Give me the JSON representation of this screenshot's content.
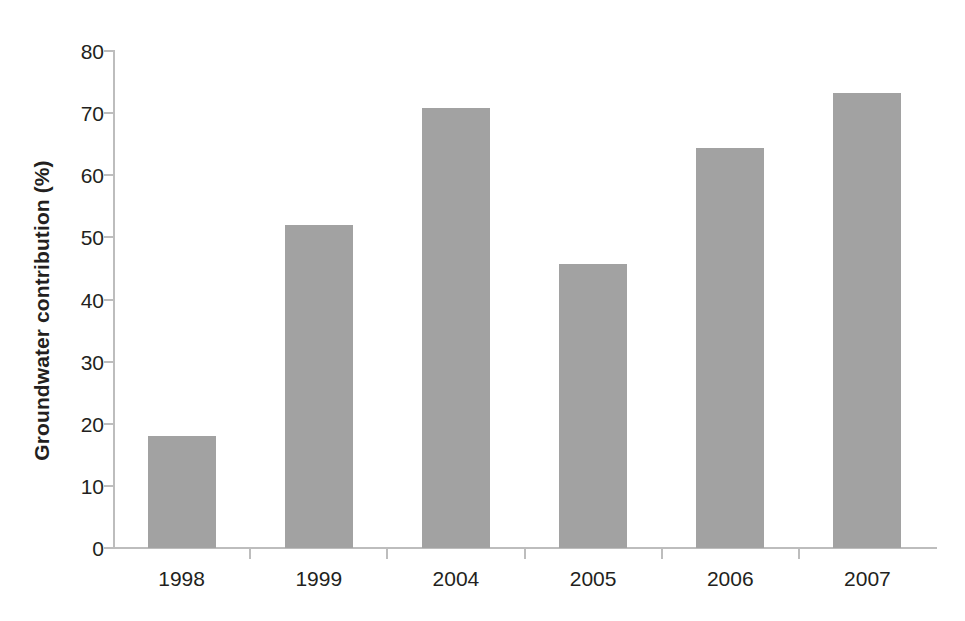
{
  "chart_data": {
    "type": "bar",
    "title": "",
    "xlabel": "",
    "ylabel": "Groundwater contribution (%)",
    "categories": [
      "1998",
      "1999",
      "2004",
      "2005",
      "2006",
      "2007"
    ],
    "values": [
      18.0,
      52.0,
      70.8,
      45.7,
      64.4,
      73.3
    ],
    "series": [
      {
        "name": "Groundwater contribution",
        "values": [
          18.0,
          52.0,
          70.8,
          45.7,
          64.4,
          73.3
        ]
      }
    ],
    "ylim": [
      0,
      80
    ],
    "yticks": [
      0,
      10,
      20,
      30,
      40,
      50,
      60,
      70,
      80
    ],
    "ytick_labels": [
      "0",
      "10",
      "20",
      "30",
      "40",
      "50",
      "60",
      "70",
      "80"
    ],
    "grid": false,
    "legend": false,
    "legend_position": "none",
    "bar_color": "#a2a2a2",
    "axis_color": "#bdbdbd",
    "text_color": "#231f20",
    "background_color": "#ffffff"
  }
}
